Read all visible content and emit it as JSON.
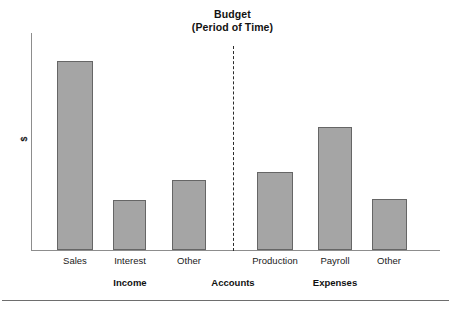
{
  "chart_data": {
    "type": "bar",
    "title": "Budget",
    "subtitle": "(Period of Time)",
    "xlabel": "Accounts",
    "ylabel": "$",
    "grid": false,
    "legend": null,
    "ylim": [
      0,
      100
    ],
    "axis_tick_labels": [],
    "categories": [
      "Sales",
      "Interest",
      "Other",
      "Production",
      "Payroll",
      "Other"
    ],
    "values": [
      87,
      23,
      32,
      36,
      57,
      24
    ],
    "groups": [
      {
        "name": "Income",
        "categories": [
          "Sales",
          "Interest",
          "Other"
        ],
        "values": [
          87,
          23,
          32
        ]
      },
      {
        "name": "Expenses",
        "categories": [
          "Production",
          "Payroll",
          "Other"
        ],
        "values": [
          36,
          57,
          24
        ]
      }
    ],
    "annotations": [
      {
        "type": "divider",
        "style": "dashed",
        "between": [
          "Income",
          "Expenses"
        ]
      }
    ],
    "bar_color": "#a5a5a5",
    "bar_border_color": "#666666",
    "axis_color": "#8d8d8d"
  },
  "title": {
    "main": "Budget",
    "sub": "(Period of Time)"
  },
  "axes": {
    "y_label": "$",
    "x_group_label": "Accounts"
  },
  "bars": [
    {
      "label": "Sales",
      "value": 87,
      "left": 57,
      "width": 36,
      "top": 61,
      "height": 189
    },
    {
      "label": "Interest",
      "value": 23,
      "left": 113,
      "width": 33,
      "top": 200,
      "height": 50
    },
    {
      "label": "Other",
      "value": 32,
      "left": 172,
      "width": 34,
      "top": 180,
      "height": 70
    },
    {
      "label": "Production",
      "value": 36,
      "left": 257,
      "width": 36,
      "top": 172,
      "height": 78
    },
    {
      "label": "Payroll",
      "value": 57,
      "left": 318,
      "width": 34,
      "top": 127,
      "height": 123
    },
    {
      "label": "Other",
      "value": 24,
      "left": 372,
      "width": 35,
      "top": 199,
      "height": 51
    }
  ],
  "category_labels": [
    {
      "text": "Sales",
      "center": 75
    },
    {
      "text": "Interest",
      "center": 130
    },
    {
      "text": "Other",
      "center": 189
    },
    {
      "text": "Production",
      "center": 275
    },
    {
      "text": "Payroll",
      "center": 335
    },
    {
      "text": "Other",
      "center": 389
    }
  ],
  "group_labels": [
    {
      "text": "Income",
      "center": 130
    },
    {
      "text": "Accounts",
      "center": 233
    },
    {
      "text": "Expenses",
      "center": 335
    }
  ]
}
